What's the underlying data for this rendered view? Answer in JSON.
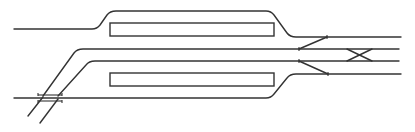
{
  "diagram": {
    "type": "railway-track-layout",
    "colors": {
      "line": "#333333",
      "background": "#ffffff"
    },
    "tracks": [
      {
        "id": "track-1",
        "path": "M14 29 L92 29 Q97 29 100 25 L107 15 Q110 11 116 11 L266 11 Q271 11 274 15 L287 33 Q290 37 296 37 L401 37"
      },
      {
        "id": "track-2",
        "path": "M43 96 L74 53 Q77 49 83 49 L399 49"
      },
      {
        "id": "track-3",
        "path": "M58 96 L86 65 Q89 61 95 61 L399 61"
      },
      {
        "id": "track-4",
        "path": "M14 98 L266 98 Q271 98 274 94 L287 78 Q290 74 296 74 L401 74"
      }
    ],
    "platforms": [
      {
        "id": "platform-upper",
        "x": 110,
        "y": 23,
        "width": 164,
        "height": 13
      },
      {
        "id": "platform-lower",
        "x": 110,
        "y": 73,
        "width": 164,
        "height": 13
      }
    ],
    "switches": [
      {
        "id": "switch-upper",
        "path": "M299 49 L327 37"
      },
      {
        "id": "switch-lower",
        "path": "M299 61 L328 74"
      }
    ],
    "crossover": {
      "id": "scissors-crossover",
      "paths": [
        "M347 61 L372 49",
        "M347 49 L372 61"
      ]
    },
    "bridge": {
      "id": "underpass",
      "lines": [
        "M28 116 L43 97",
        "M40 123 L58 99"
      ],
      "deck": [
        "M38 95 L62 95",
        "M38 101 L62 101"
      ]
    }
  }
}
